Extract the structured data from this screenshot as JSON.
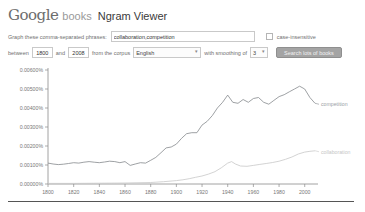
{
  "header": {
    "logo_google": "Google",
    "logo_books": "books",
    "title": "Ngram Viewer"
  },
  "form": {
    "phrases_label": "Graph these comma-separated phrases:",
    "phrases_value": "collaboration,competition",
    "case_insensitive_label": "case-insensitive",
    "between_label": "between",
    "year_start": "1800",
    "and_label": "and",
    "year_end": "2008",
    "corpus_label": "from the corpus",
    "corpus_value": "English",
    "smoothing_label": "with smoothing of",
    "smoothing_value": "3",
    "search_button": "Search lots of books"
  },
  "chart_data": {
    "type": "line",
    "title": "",
    "xlabel": "Year",
    "ylabel": "Usage frequency (%)",
    "xlim": [
      1800,
      2008
    ],
    "ylim": [
      0,
      0.006
    ],
    "grid": false,
    "legend_position": "line-end-labels",
    "yticks": [
      "0.00600%",
      "0.00500%",
      "0.00400%",
      "0.00300%",
      "0.00200%",
      "0.00100%",
      "0.00000%"
    ],
    "ytick_values": [
      0.006,
      0.005,
      0.004,
      0.003,
      0.002,
      0.001,
      0
    ],
    "xticks": [
      1800,
      1820,
      1840,
      1860,
      1880,
      1900,
      1920,
      1940,
      1960,
      1980,
      2000
    ],
    "series": [
      {
        "name": "competition",
        "color": "#85898d",
        "label_color": "#9aa0a5",
        "x": [
          1800,
          1804,
          1808,
          1812,
          1816,
          1820,
          1824,
          1828,
          1832,
          1836,
          1840,
          1844,
          1848,
          1852,
          1856,
          1860,
          1864,
          1868,
          1872,
          1876,
          1880,
          1884,
          1888,
          1892,
          1896,
          1900,
          1904,
          1908,
          1912,
          1916,
          1920,
          1924,
          1928,
          1932,
          1936,
          1940,
          1944,
          1948,
          1952,
          1956,
          1960,
          1964,
          1968,
          1972,
          1976,
          1980,
          1984,
          1988,
          1992,
          1996,
          2000,
          2004,
          2008
        ],
        "values": [
          0.0011,
          0.00105,
          0.00102,
          0.00104,
          0.00108,
          0.00112,
          0.0011,
          0.00115,
          0.00118,
          0.00115,
          0.00112,
          0.00116,
          0.0012,
          0.00118,
          0.00112,
          0.00118,
          0.00098,
          0.00105,
          0.00112,
          0.0011,
          0.00125,
          0.0014,
          0.00165,
          0.0019,
          0.00195,
          0.0021,
          0.0024,
          0.00265,
          0.0027,
          0.0027,
          0.0031,
          0.0033,
          0.0036,
          0.004,
          0.0043,
          0.00468,
          0.0043,
          0.00425,
          0.00445,
          0.0043,
          0.0045,
          0.00455,
          0.0043,
          0.0042,
          0.0044,
          0.0046,
          0.0047,
          0.00485,
          0.005,
          0.00515,
          0.005,
          0.00455,
          0.00425
        ]
      },
      {
        "name": "collaboration",
        "color": "#c8c8c8",
        "label_color": "#c6c6c6",
        "x": [
          1800,
          1820,
          1840,
          1860,
          1880,
          1890,
          1900,
          1905,
          1910,
          1915,
          1920,
          1925,
          1930,
          1935,
          1940,
          1943,
          1946,
          1950,
          1955,
          1960,
          1965,
          1970,
          1975,
          1980,
          1985,
          1990,
          1995,
          2000,
          2004,
          2008
        ],
        "values": [
          3e-05,
          3e-05,
          4e-05,
          5e-05,
          8e-05,
          0.00012,
          0.00018,
          0.00022,
          0.00028,
          0.00035,
          0.00042,
          0.00052,
          0.00065,
          0.00085,
          0.0011,
          0.00118,
          0.00105,
          0.00095,
          0.00093,
          0.00098,
          0.00103,
          0.00108,
          0.00113,
          0.0012,
          0.0013,
          0.00142,
          0.00158,
          0.00168,
          0.00172,
          0.00175
        ]
      }
    ]
  }
}
